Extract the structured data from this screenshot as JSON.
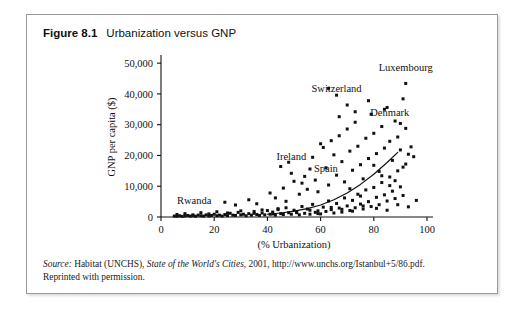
{
  "figure": {
    "label": "Figure 8.1",
    "caption": "Urbanization versus GNP"
  },
  "source": {
    "lead": "Source:",
    "body_before_title": " Habitat (UNCHS), ",
    "title": "State of the World's Cities",
    "body_after_title": ", 2001, http://www.unchs.org/Istanbul+5/86.pdf.",
    "line2": "Reprinted with permission."
  },
  "chart_data": {
    "type": "scatter",
    "title": "Urbanization versus GNP",
    "xlabel": "(% Urbanization)",
    "ylabel": "GNP per capita ($)",
    "xlim": [
      0,
      100
    ],
    "ylim": [
      0,
      52000
    ],
    "xticks": [
      0,
      20,
      40,
      60,
      80,
      100
    ],
    "xtick_labels": [
      "0",
      "20",
      "40",
      "60",
      "80",
      "100"
    ],
    "yticks": [
      0,
      10000,
      20000,
      30000,
      40000,
      50000
    ],
    "ytick_labels": [
      "0",
      "10,000",
      "20,000",
      "30,000",
      "40,000",
      "50,000"
    ],
    "grid": false,
    "legend": null,
    "marker": "square",
    "marker_color": "#111111",
    "trend": {
      "type": "exponential",
      "color": "#111111",
      "points": [
        [
          40,
          900
        ],
        [
          45,
          1300
        ],
        [
          50,
          1900
        ],
        [
          55,
          2700
        ],
        [
          60,
          3900
        ],
        [
          65,
          5600
        ],
        [
          70,
          7800
        ],
        [
          75,
          10600
        ],
        [
          80,
          13900
        ],
        [
          85,
          17700
        ],
        [
          89,
          21000
        ]
      ]
    },
    "annotations": [
      {
        "text": "Rwanda",
        "x": 6,
        "y": 4200,
        "anchor": "start"
      },
      {
        "text": "Ireland",
        "x": 49,
        "y": 18500,
        "anchor": "middle"
      },
      {
        "text": "Spain",
        "x": 62,
        "y": 14600,
        "anchor": "middle"
      },
      {
        "text": "Switzerland",
        "x": 66,
        "y": 40600,
        "anchor": "middle"
      },
      {
        "text": "Denmark",
        "x": 86,
        "y": 32800,
        "anchor": "middle"
      },
      {
        "text": "Luxembourg",
        "x": 92,
        "y": 47500,
        "anchor": "middle"
      }
    ],
    "points": [
      [
        5,
        300
      ],
      [
        6,
        250
      ],
      [
        7,
        400
      ],
      [
        8,
        200
      ],
      [
        9,
        350
      ],
      [
        10,
        500
      ],
      [
        11,
        300
      ],
      [
        12,
        450
      ],
      [
        13,
        250
      ],
      [
        14,
        600
      ],
      [
        15,
        400
      ],
      [
        16,
        300
      ],
      [
        17,
        700
      ],
      [
        18,
        350
      ],
      [
        19,
        500
      ],
      [
        20,
        900
      ],
      [
        21,
        400
      ],
      [
        22,
        600
      ],
      [
        23,
        300
      ],
      [
        24,
        800
      ],
      [
        25,
        450
      ],
      [
        26,
        1200
      ],
      [
        27,
        600
      ],
      [
        28,
        500
      ],
      [
        29,
        1500
      ],
      [
        30,
        700
      ],
      [
        31,
        900
      ],
      [
        32,
        400
      ],
      [
        33,
        1100
      ],
      [
        34,
        600
      ],
      [
        35,
        1800
      ],
      [
        36,
        800
      ],
      [
        37,
        500
      ],
      [
        38,
        1300
      ],
      [
        39,
        700
      ],
      [
        40,
        2100
      ],
      [
        41,
        900
      ],
      [
        42,
        1600
      ],
      [
        43,
        600
      ],
      [
        44,
        2400
      ],
      [
        45,
        1100
      ],
      [
        46,
        800
      ],
      [
        47,
        3000
      ],
      [
        48,
        1400
      ],
      [
        49,
        900
      ],
      [
        50,
        2200
      ],
      [
        51,
        1700
      ],
      [
        52,
        700
      ],
      [
        53,
        3400
      ],
      [
        54,
        1200
      ],
      [
        55,
        2600
      ],
      [
        56,
        900
      ],
      [
        57,
        4100
      ],
      [
        58,
        1500
      ],
      [
        59,
        2000
      ],
      [
        60,
        1000
      ],
      [
        61,
        3200
      ],
      [
        62,
        1800
      ],
      [
        63,
        5200
      ],
      [
        64,
        2400
      ],
      [
        65,
        1300
      ],
      [
        66,
        4400
      ],
      [
        67,
        2900
      ],
      [
        68,
        1600
      ],
      [
        69,
        6200
      ],
      [
        70,
        3600
      ],
      [
        71,
        2100
      ],
      [
        72,
        5400
      ],
      [
        73,
        3000
      ],
      [
        74,
        7400
      ],
      [
        75,
        4200
      ],
      [
        76,
        2600
      ],
      [
        77,
        8800
      ],
      [
        78,
        5000
      ],
      [
        79,
        3400
      ],
      [
        80,
        9600
      ],
      [
        81,
        6400
      ],
      [
        82,
        4000
      ],
      [
        83,
        11200
      ],
      [
        84,
        7200
      ],
      [
        85,
        5200
      ],
      [
        86,
        13000
      ],
      [
        87,
        8400
      ],
      [
        88,
        6000
      ],
      [
        89,
        15000
      ],
      [
        90,
        9800
      ],
      [
        91,
        7000
      ],
      [
        92,
        17200
      ],
      [
        24,
        4800
      ],
      [
        28,
        3900
      ],
      [
        33,
        5600
      ],
      [
        36,
        4300
      ],
      [
        41,
        7800
      ],
      [
        43,
        6200
      ],
      [
        46,
        9400
      ],
      [
        47,
        5100
      ],
      [
        48,
        17800
      ],
      [
        50,
        11600
      ],
      [
        52,
        7400
      ],
      [
        54,
        13200
      ],
      [
        55,
        9000
      ],
      [
        57,
        19400
      ],
      [
        58,
        12000
      ],
      [
        59,
        8200
      ],
      [
        61,
        22600
      ],
      [
        62,
        16000
      ],
      [
        63,
        10400
      ],
      [
        64,
        24800
      ],
      [
        65,
        20200
      ],
      [
        66,
        13600
      ],
      [
        67,
        26400
      ],
      [
        68,
        18000
      ],
      [
        69,
        11400
      ],
      [
        70,
        28600
      ],
      [
        71,
        21400
      ],
      [
        72,
        15200
      ],
      [
        73,
        30800
      ],
      [
        74,
        23000
      ],
      [
        75,
        17000
      ],
      [
        76,
        12400
      ],
      [
        77,
        25600
      ],
      [
        78,
        19000
      ],
      [
        79,
        33400
      ],
      [
        80,
        27200
      ],
      [
        81,
        20600
      ],
      [
        82,
        14800
      ],
      [
        83,
        29400
      ],
      [
        84,
        22400
      ],
      [
        85,
        35600
      ],
      [
        86,
        24600
      ],
      [
        87,
        18400
      ],
      [
        88,
        31200
      ],
      [
        89,
        26000
      ],
      [
        90,
        21800
      ],
      [
        91,
        38400
      ],
      [
        92,
        28800
      ],
      [
        63,
        41800
      ],
      [
        66,
        39600
      ],
      [
        70,
        36400
      ],
      [
        73,
        34200
      ],
      [
        78,
        37800
      ],
      [
        84,
        35000
      ],
      [
        90,
        30400
      ],
      [
        92,
        43400
      ],
      [
        45,
        16400
      ],
      [
        49,
        14200
      ],
      [
        53,
        11000
      ],
      [
        56,
        15600
      ],
      [
        60,
        23800
      ],
      [
        67,
        32600
      ],
      [
        71,
        9200
      ],
      [
        75,
        6800
      ],
      [
        80,
        16800
      ],
      [
        83,
        13400
      ],
      [
        86,
        10200
      ],
      [
        88,
        11800
      ],
      [
        91,
        16200
      ],
      [
        93,
        20400
      ],
      [
        94,
        22800
      ],
      [
        95,
        19600
      ],
      [
        6,
        800
      ],
      [
        9,
        1100
      ],
      [
        12,
        700
      ],
      [
        15,
        1400
      ],
      [
        18,
        1000
      ],
      [
        21,
        1700
      ],
      [
        25,
        1300
      ],
      [
        30,
        2000
      ],
      [
        35,
        1200
      ],
      [
        38,
        2300
      ],
      [
        42,
        1000
      ],
      [
        44,
        2700
      ],
      [
        51,
        1400
      ],
      [
        56,
        2200
      ],
      [
        59,
        1100
      ],
      [
        64,
        3100
      ],
      [
        68,
        2500
      ],
      [
        72,
        1900
      ],
      [
        76,
        3600
      ],
      [
        81,
        2800
      ],
      [
        85,
        2200
      ],
      [
        89,
        4000
      ],
      [
        93,
        3300
      ],
      [
        96,
        5400
      ]
    ]
  }
}
